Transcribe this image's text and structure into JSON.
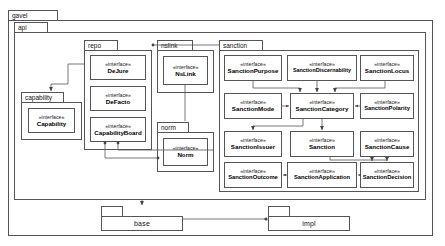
{
  "diagram": {
    "type": "uml-package-diagram",
    "stereotype_label": "«interface»"
  },
  "packages": {
    "gavel": {
      "label": "gavel"
    },
    "api": {
      "label": "api"
    },
    "capability": {
      "label": "capability"
    },
    "repo": {
      "label": "repo"
    },
    "nslink": {
      "label": "nslink"
    },
    "norm": {
      "label": "norm"
    },
    "sanction": {
      "label": "sanction"
    },
    "base": {
      "label": "base"
    },
    "impl": {
      "label": "impl"
    }
  },
  "interfaces": {
    "capability": {
      "stereotype": "«interface»",
      "name": "Capability"
    },
    "dejure": {
      "stereotype": "«interface»",
      "name": "DeJure"
    },
    "defacto": {
      "stereotype": "«interface»",
      "name": "DeFacto"
    },
    "capabilityboard": {
      "stereotype": "«interface»",
      "name": "CapabilityBoard"
    },
    "nslink": {
      "stereotype": "«interface»",
      "name": "NsLink"
    },
    "norm": {
      "stereotype": "«interface»",
      "name": "Norm"
    },
    "sanctionpurpose": {
      "stereotype": "«interface»",
      "name": "SanctionPurpose"
    },
    "sanctiondiscernability": {
      "stereotype": "«interface»",
      "name": "SanctionDiscernability"
    },
    "sanctionlocus": {
      "stereotype": "«interface»",
      "name": "SanctionLocus"
    },
    "sanctionmode": {
      "stereotype": "«interface»",
      "name": "SanctionMode"
    },
    "sanctioncategory": {
      "stereotype": "«interface»",
      "name": "SanctionCategory"
    },
    "sanctionpolarity": {
      "stereotype": "«interface»",
      "name": "SanctionPolarity"
    },
    "sanctionissuer": {
      "stereotype": "«interface»",
      "name": "SanctionIssuer"
    },
    "sanction": {
      "stereotype": "«interface»",
      "name": "Sanction"
    },
    "sanctioncause": {
      "stereotype": "«interface»",
      "name": "SanctionCause"
    },
    "sanctionoutcome": {
      "stereotype": "«interface»",
      "name": "SanctionOutcome"
    },
    "sanctionapplication": {
      "stereotype": "«interface»",
      "name": "SanctionApplication"
    },
    "sanctiondecision": {
      "stereotype": "«interface»",
      "name": "SanctionDecision"
    }
  },
  "colors": {
    "line": "#555555",
    "background": "#ffffff",
    "text": "#111111"
  }
}
